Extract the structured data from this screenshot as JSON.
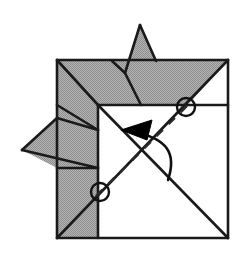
{
  "document": {
    "kind": "origami-folding-diagram",
    "title": "Origami fold step diagram",
    "canvas": {
      "width": 248,
      "height": 266,
      "background": "#ffffff"
    }
  },
  "palette": {
    "paper_front": "#ffffff",
    "paper_back": "#a8a8a8",
    "paper_back_shadow": "#9a9a9a",
    "line": "#1a1a1a",
    "arrow_fill": "#000000",
    "crease_dash": "#2b2b2b",
    "circle_stroke": "#111111"
  },
  "geometry": {
    "outer_square": {
      "left": 57,
      "top": 60,
      "right": 228,
      "bottom": 238
    },
    "inner_white_square": {
      "left": 98,
      "top": 105,
      "right": 228,
      "bottom": 238
    },
    "top_spike_tip": {
      "x": 140,
      "y": 25
    },
    "left_spike_tip": {
      "x": 22,
      "y": 150
    },
    "circle_top_right": {
      "cx": 186,
      "cy": 107,
      "r": 9
    },
    "circle_bottom_left": {
      "cx": 100,
      "cy": 192,
      "r": 9
    },
    "dashed_crease": {
      "x1": 100,
      "y1": 192,
      "x2": 186,
      "y2": 107
    },
    "arrow_tip": {
      "x": 122,
      "y": 131
    },
    "arrow_tail": {
      "x": 170,
      "y": 182
    }
  },
  "shapes": {
    "gray_regions": [
      {
        "name": "top-left-gray-flap",
        "points": "57,60 98,105 57,105"
      },
      {
        "name": "top-band-gray",
        "points": "57,60 228,60 186,107 98,105"
      },
      {
        "name": "top-spike-gray",
        "points": "140,25 155,60 113,60 124,72"
      },
      {
        "name": "left-column-gray",
        "points": "57,105 98,105 98,238 57,238"
      },
      {
        "name": "left-spike-gray",
        "points": "22,150 57,118 98,130 98,168 57,168"
      }
    ],
    "solid_lines": [
      {
        "name": "outer-square-top",
        "d": "M57,60 L228,60"
      },
      {
        "name": "outer-square-right",
        "d": "M228,60 L228,238"
      },
      {
        "name": "outer-square-bottom",
        "d": "M57,238 L228,238"
      },
      {
        "name": "outer-square-left",
        "d": "M57,60 L57,238"
      },
      {
        "name": "inner-square-top-edge",
        "d": "M98,105 L228,105"
      },
      {
        "name": "inner-square-left-edge",
        "d": "M98,105 L98,238"
      },
      {
        "name": "diagonal-top-left-to-center",
        "d": "M57,60 L98,105"
      },
      {
        "name": "diagonal-top-right-to-bottom-left",
        "d": "M228,60 L57,238"
      },
      {
        "name": "diagonal-top-left-inner-to-bottom-right",
        "d": "M98,105 L228,238"
      },
      {
        "name": "spike-left-edge",
        "d": "M140,25 L124,72"
      },
      {
        "name": "spike-right-edge",
        "d": "M140,25 L155,60"
      },
      {
        "name": "spike-base-fold",
        "d": "M124,72 L113,60"
      },
      {
        "name": "spike-inner-fold",
        "d": "M124,72 L140,105"
      },
      {
        "name": "left-spike-upper",
        "d": "M22,150 L57,118"
      },
      {
        "name": "left-spike-fold-a",
        "d": "M57,118 L98,130"
      },
      {
        "name": "left-spike-lower",
        "d": "M22,150 L98,168"
      },
      {
        "name": "left-flap-fold",
        "d": "M57,105 L98,130"
      }
    ]
  },
  "annotations": {
    "circles": [
      {
        "name": "reference-point-top-right",
        "cx": 186,
        "cy": 107,
        "r": 9
      },
      {
        "name": "reference-point-bottom-left",
        "cx": 100,
        "cy": 192,
        "r": 9
      }
    ],
    "dashed_crease_line": "M100,192 L186,107",
    "fold_arrow_path": "M168,180 C176,152 166,138 132,131",
    "arrowhead_points": "122,131 150,121 146,139"
  }
}
